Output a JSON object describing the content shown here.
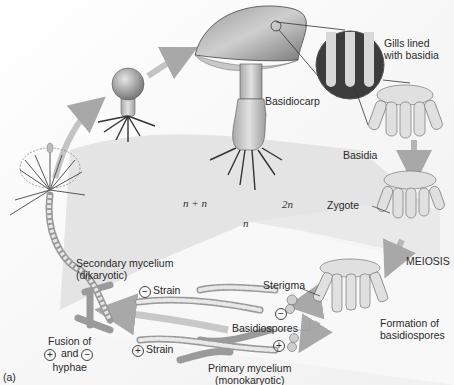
{
  "diagram": {
    "type": "life-cycle",
    "panel_label": "(a)",
    "labels": {
      "gills": [
        "Gills lined",
        "with basidia"
      ],
      "basidiocarp": "Basidiocarp",
      "basidia": "Basidia",
      "zygote": "Zygote",
      "meiosis": "MEIOSIS",
      "formation": [
        "Formation of",
        "basidiospores"
      ],
      "sterigma": "Sterigma",
      "basidiospores": "Basidiospores",
      "primary": [
        "Primary mycelium",
        "(monokaryotic)"
      ],
      "secondary": [
        "Secondary mycelium",
        "(dikaryotic)"
      ],
      "minus_strain": "Strain",
      "plus_strain": "Strain",
      "fusion": [
        "Fusion of",
        "and",
        "hyphae"
      ],
      "plus_symbol": "+",
      "minus_symbol": "−"
    },
    "ploidy": {
      "n_plus_n": "n + n",
      "two_n": "2n",
      "n": "n"
    },
    "colors": {
      "dikaryotic_zone": "#dcdcdc",
      "diploid_zone": "#e6e6e6",
      "haploid_zone": "#f7f7f7",
      "arrow": "#bdbdbd",
      "structure_fill": "#d9d9d9",
      "structure_stroke": "#555555"
    }
  }
}
